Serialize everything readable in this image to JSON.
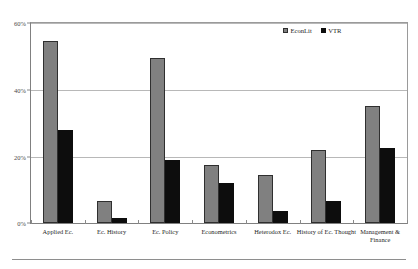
{
  "legend": {
    "position": "top-right",
    "items": [
      {
        "label": "EconLit",
        "color": "#808080",
        "swatch": "square-marker-icon"
      },
      {
        "label": "VTR",
        "color": "#0d0d0d",
        "swatch": "square-marker-icon"
      }
    ]
  },
  "axis": {
    "y_ticks": [
      "0%",
      "20%",
      "40%",
      "60%"
    ],
    "y_min": 0,
    "y_max": 60
  },
  "chart_data": {
    "type": "bar",
    "title": "",
    "subtitle": "",
    "xlabel": "",
    "ylabel": "",
    "ylim": [
      0,
      60
    ],
    "grid": true,
    "legend_position": "top-right",
    "categories": [
      "Applied Ec.",
      "Ec. History",
      "Ec. Policy",
      "Econometrics",
      "Heterodox Ec.",
      "History of Ec. Thought",
      "Management &\nFinance"
    ],
    "tick_labels": [
      "0%",
      "20%",
      "40%",
      "60%"
    ],
    "series": [
      {
        "name": "EconLit",
        "color": "#808080",
        "values": [
          54.5,
          6.5,
          49.5,
          17.5,
          14.5,
          22.0,
          35.0
        ]
      },
      {
        "name": "VTR",
        "color": "#0d0d0d",
        "values": [
          28.0,
          1.5,
          19.0,
          12.0,
          3.5,
          6.5,
          22.5
        ]
      }
    ]
  }
}
